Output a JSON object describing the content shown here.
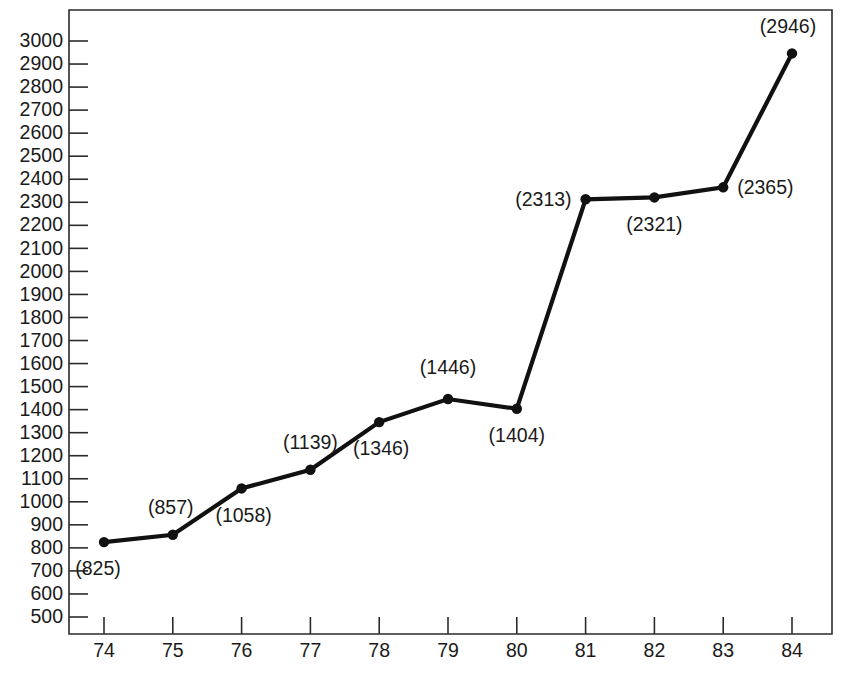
{
  "chart_data": {
    "type": "line",
    "title": "",
    "subtitle": "",
    "xlabel": "",
    "ylabel": "",
    "categories": [
      "74",
      "75",
      "76",
      "77",
      "78",
      "79",
      "80",
      "81",
      "82",
      "83",
      "84"
    ],
    "values": [
      825,
      857,
      1058,
      1139,
      1346,
      1446,
      1404,
      2313,
      2321,
      2365,
      2946
    ],
    "point_labels": [
      "(825)",
      "(857)",
      "(1058)",
      "(1139)",
      "(1346)",
      "(1446)",
      "(1404)",
      "(2313)",
      "(2321)",
      "(2365)",
      "(2946)"
    ],
    "xlim": [
      74,
      84
    ],
    "ylim": [
      500,
      3000
    ],
    "y_ticks": [
      3000,
      2900,
      2800,
      2700,
      2600,
      2500,
      2400,
      2300,
      2200,
      2100,
      2000,
      1900,
      1800,
      1700,
      1600,
      1500,
      1400,
      1300,
      1200,
      1100,
      1000,
      900,
      800,
      700,
      600,
      500
    ],
    "y_tick_labels": [
      "3000",
      "2900",
      "2800",
      "2700",
      "2600",
      "2500",
      "2400",
      "2300",
      "2200",
      "2100",
      "2000",
      "1900",
      "1800",
      "1700",
      "1600",
      "1500",
      "1400",
      "1300",
      "1200",
      "1100",
      "1000",
      "900",
      "800",
      "700",
      "600",
      "500"
    ],
    "x_ticks": [
      74,
      75,
      76,
      77,
      78,
      79,
      80,
      81,
      82,
      83,
      84
    ],
    "x_tick_labels": [
      "74",
      "75",
      "76",
      "77",
      "78",
      "79",
      "80",
      "81",
      "82",
      "83",
      "84"
    ],
    "grid": false,
    "legend": false,
    "legend_position": "none",
    "series": [
      {
        "name": "series-1",
        "values": [
          825,
          857,
          1058,
          1139,
          1346,
          1446,
          1404,
          2313,
          2321,
          2365,
          2946
        ],
        "line_color": "#111111",
        "marker_color": "#111111",
        "marker": "circle"
      }
    ],
    "label_offsets": [
      {
        "dx": -6,
        "dy": 28,
        "anchor": "middle"
      },
      {
        "dx": -2,
        "dy": -26,
        "anchor": "middle"
      },
      {
        "dx": 2,
        "dy": 28,
        "anchor": "middle"
      },
      {
        "dx": 0,
        "dy": -26,
        "anchor": "middle"
      },
      {
        "dx": 2,
        "dy": 28,
        "anchor": "middle"
      },
      {
        "dx": 0,
        "dy": -30,
        "anchor": "middle"
      },
      {
        "dx": 0,
        "dy": 28,
        "anchor": "middle"
      },
      {
        "dx": -14,
        "dy": 2,
        "anchor": "end"
      },
      {
        "dx": 0,
        "dy": 28,
        "anchor": "middle"
      },
      {
        "dx": 14,
        "dy": 2,
        "anchor": "start"
      },
      {
        "dx": -4,
        "dy": -26,
        "anchor": "middle"
      }
    ],
    "colors": {
      "background": "#ffffff",
      "axis": "#2b2b2b",
      "line": "#111111",
      "text": "#1a1a1a"
    }
  },
  "geometry": {
    "plot_left": 69,
    "plot_right": 832,
    "plot_top": 10,
    "plot_bottom": 634,
    "x_first_tick": 104,
    "x_tick_step": 68.8,
    "y_top_value_px": 41,
    "y_bottom_value_px": 617
  }
}
